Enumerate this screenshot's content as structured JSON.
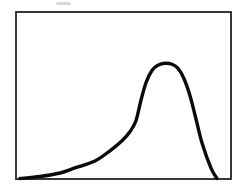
{
  "figure": {
    "background": "#ffffff",
    "frame_color": "#232323",
    "frame_stroke_width": 1.8,
    "curve_color": "#0b0b0b",
    "curve_stroke_width": 3.4
  },
  "chart_data": {
    "type": "line",
    "title": "",
    "xlabel": "",
    "ylabel": "",
    "xlim": [
      0,
      100
    ],
    "ylim": [
      0,
      100
    ],
    "grid": false,
    "legend": false,
    "axes_ticks_visible": false,
    "note": "Unlabeled framed curve: left-skewed peak rising slowly from baseline at left, steep ascent to rounded maximum about two-thirds across, steep descent back to baseline near right edge.",
    "series": [
      {
        "name": "skewed-peak-curve",
        "x": [
          1.9,
          11.2,
          20.5,
          27.4,
          36.7,
          43.7,
          49.3,
          53.0,
          55.8,
          58.1,
          60.5,
          63.3,
          66.0,
          69.3,
          72.6,
          75.3,
          78.1,
          80.9,
          83.7,
          86.5,
          90.7,
          93.5
        ],
        "y": [
          0.3,
          1.5,
          3.6,
          6.6,
          10.8,
          16.9,
          22.9,
          28.3,
          34.9,
          47.0,
          57.8,
          65.1,
          68.1,
          69.3,
          68.7,
          66.3,
          60.2,
          50.0,
          36.1,
          21.7,
          6.5,
          0.3
        ]
      }
    ]
  }
}
